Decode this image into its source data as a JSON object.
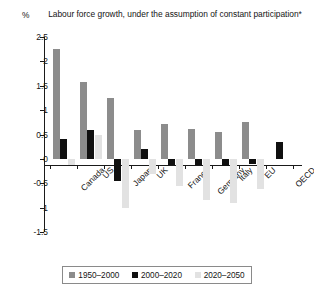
{
  "unit_label": "%",
  "chart_data": {
    "type": "bar",
    "title": "Labour force growth, under the assumption of constant participation*",
    "xlabel": "",
    "ylabel": "%",
    "ylim": [
      -1.5,
      2.5
    ],
    "yticks": [
      2.5,
      2,
      1.5,
      1,
      0.5,
      0,
      -0.5,
      -1,
      -1.5
    ],
    "ytick_labels": [
      "2.5",
      "2",
      "1.5",
      "1",
      "0.5",
      "0",
      "-0.5",
      "-1",
      "-1.5"
    ],
    "grid": false,
    "legend_position": "bottom",
    "categories": [
      "Canada",
      "US",
      "Japan",
      "UK",
      "France",
      "Germany",
      "Italy",
      "EU",
      "OECD"
    ],
    "series": [
      {
        "name": "1950-2000",
        "color": "#8c8c8c",
        "values": [
          2.25,
          1.58,
          1.25,
          0.6,
          0.72,
          0.62,
          0.55,
          0.75,
          0.0
        ]
      },
      {
        "name": "2000-2020",
        "color": "#101010",
        "values": [
          0.4,
          0.6,
          -0.45,
          0.2,
          -0.12,
          -0.12,
          -0.15,
          -0.1,
          0.35
        ]
      },
      {
        "name": "2020-2050",
        "color": "#e2e2e2",
        "values": [
          -0.12,
          0.48,
          -1.0,
          -0.3,
          -0.55,
          -0.85,
          -0.9,
          -0.62,
          0.0
        ]
      }
    ]
  },
  "legend": {
    "entries": [
      {
        "label": "1950–2000",
        "color": "#8c8c8c"
      },
      {
        "label": "2000–2020",
        "color": "#101010"
      },
      {
        "label": "2020–2050",
        "color": "#e2e2e2"
      }
    ]
  }
}
